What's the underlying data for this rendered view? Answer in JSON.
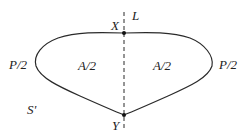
{
  "diagram": {
    "line_label": "L",
    "top_point_label": "X",
    "bottom_point_label": "Y",
    "left_perimeter_label": "P/2",
    "right_perimeter_label": "P/2",
    "left_area_label": "A/2",
    "right_area_label": "A/2",
    "region_label": "S'",
    "colors": {
      "stroke": "#2a2a2a",
      "background": "#ffffff"
    }
  }
}
